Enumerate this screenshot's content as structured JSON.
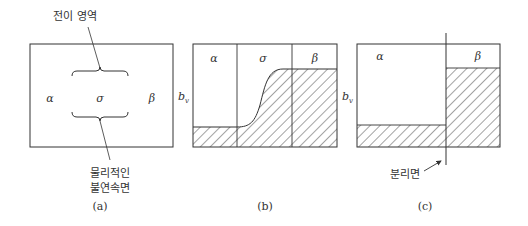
{
  "panel_a": {
    "top_label": "전이 영역",
    "phase_left": "α",
    "phase_middle": "σ",
    "phase_right": "β",
    "bottom_label_line1": "물리적인",
    "bottom_label_line2": "불연속면",
    "caption": "(a)"
  },
  "panel_b": {
    "phase_left": "α",
    "phase_middle": "σ",
    "phase_right": "β",
    "axis_label": "b",
    "axis_sub": "v",
    "caption": "(b)"
  },
  "panel_c": {
    "phase_left": "α",
    "phase_right": "β",
    "axis_label": "b",
    "axis_sub": "v",
    "surface_label": "분리면",
    "caption": "(c)"
  },
  "colors": {
    "line": "#333333",
    "background": "#ffffff"
  }
}
